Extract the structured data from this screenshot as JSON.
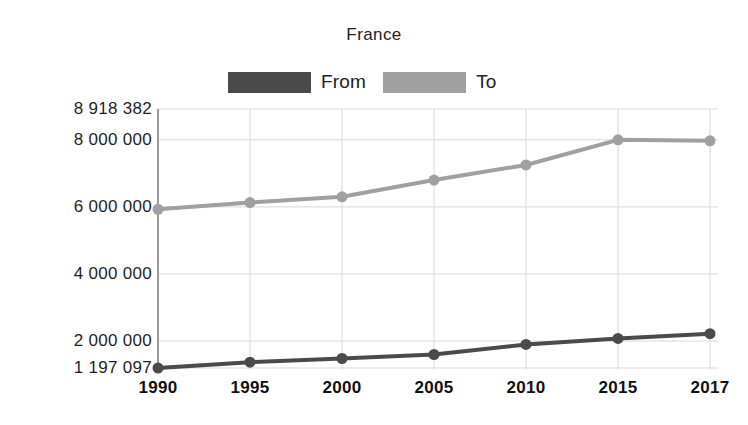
{
  "chart_data": {
    "type": "line",
    "title": "France",
    "xlabel": "",
    "ylabel": "",
    "x": [
      1990,
      1995,
      2000,
      2005,
      2010,
      2015,
      2017
    ],
    "categories": [
      "1990",
      "1995",
      "2000",
      "2005",
      "2010",
      "2015",
      "2017"
    ],
    "series": [
      {
        "name": "From",
        "color": "#4a4a4a",
        "values": [
          1197097,
          1370000,
          1480000,
          1600000,
          1900000,
          2080000,
          2220000
        ]
      },
      {
        "name": "To",
        "color": "#a0a0a0",
        "values": [
          5930000,
          6130000,
          6300000,
          6800000,
          7250000,
          8000000,
          7970000
        ]
      }
    ],
    "ylim": [
      1197097,
      8918382
    ],
    "xlim": [
      1990,
      2017
    ],
    "y_ticks": [
      {
        "value": 8918382,
        "label": "8 918 382"
      },
      {
        "value": 8000000,
        "label": "8 000 000"
      },
      {
        "value": 6000000,
        "label": "6 000 000"
      },
      {
        "value": 4000000,
        "label": "4 000 000"
      },
      {
        "value": 2000000,
        "label": "2 000 000"
      },
      {
        "value": 1197097,
        "label": "1 197 097"
      }
    ],
    "x_ticks": [
      "1990",
      "1995",
      "2000",
      "2005",
      "2010",
      "2015",
      "2017"
    ],
    "grid": true,
    "grid_color": "#d8d8d8",
    "legend_position": "top",
    "marker": "circle",
    "background": "#ffffff"
  },
  "legend": {
    "entries": [
      {
        "label": "From",
        "color": "#4a4a4a"
      },
      {
        "label": "To",
        "color": "#a0a0a0"
      }
    ]
  }
}
